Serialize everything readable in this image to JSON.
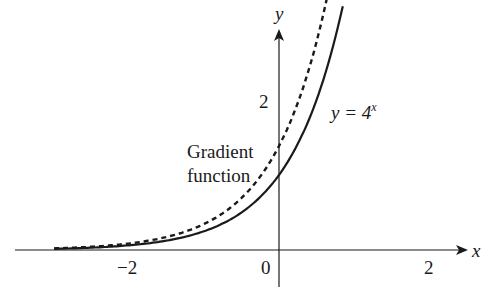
{
  "chart_data": {
    "type": "line",
    "title": "",
    "xlabel": "x",
    "ylabel": "y",
    "xlim": [
      -3.4,
      2.6
    ],
    "ylim": [
      -0.5,
      3.0
    ],
    "x_ticks": [
      "−2",
      "0",
      "2"
    ],
    "y_ticks": [
      "2"
    ],
    "grid": false,
    "series": [
      {
        "name": "y = 4^x",
        "style": "solid",
        "function": "4^x",
        "x_range": [
          -3.0,
          0.85
        ]
      },
      {
        "name": "Gradient function",
        "style": "dashed",
        "function": "ln(4)·4^x",
        "x_range": [
          -3.0,
          0.65
        ]
      }
    ],
    "annotations": [
      {
        "text": "y = 4",
        "superscript": "x",
        "position": "right of solid curve near y≈1.9"
      },
      {
        "text_lines": [
          "Gradient",
          "function"
        ],
        "position": "left of y-axis near y≈1.2"
      }
    ]
  },
  "labels": {
    "x_axis": "x",
    "y_axis": "y",
    "tick_neg2": "−2",
    "tick_0": "0",
    "tick_2": "2",
    "ytick_2": "2",
    "curve_label_main": "y = 4",
    "curve_label_sup": "x",
    "gradient_line1": "Gradient",
    "gradient_line2": "function"
  }
}
